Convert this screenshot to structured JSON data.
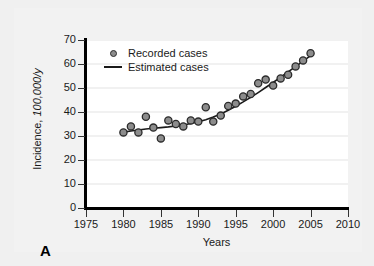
{
  "panel": {
    "label": "A"
  },
  "chart_data": {
    "type": "scatter",
    "title": "",
    "xlabel": "Years",
    "ylabel": "Incidence, 100,000/y",
    "ylabel_plain": "Incidence,",
    "ylabel_italic": " 100,000/y",
    "xlim": [
      1975,
      2010
    ],
    "ylim": [
      0,
      70
    ],
    "xticks": [
      1975,
      1980,
      1985,
      1990,
      1995,
      2000,
      2005,
      2010
    ],
    "yticks": [
      0,
      10,
      20,
      30,
      40,
      50,
      60,
      70
    ],
    "grid": "horizontal",
    "legend_position": "top-left",
    "series": [
      {
        "name": "Recorded cases",
        "type": "scatter",
        "marker": "circle",
        "marker_fill": "#8c8c8c",
        "marker_edge": "#2b2b2b",
        "x": [
          1980,
          1981,
          1982,
          1983,
          1984,
          1985,
          1986,
          1987,
          1988,
          1989,
          1990,
          1991,
          1992,
          1993,
          1994,
          1995,
          1996,
          1997,
          1998,
          1999,
          2000,
          2001,
          2002,
          2003,
          2004,
          2005
        ],
        "values": [
          31.5,
          34.0,
          31.5,
          38.0,
          33.5,
          29.0,
          36.5,
          35.0,
          34.0,
          36.5,
          36.0,
          42.0,
          36.0,
          38.5,
          42.5,
          43.5,
          46.5,
          47.5,
          52.0,
          53.5,
          51.0,
          54.0,
          55.5,
          59.0,
          61.5,
          64.5
        ]
      },
      {
        "name": "Estimated cases",
        "type": "line",
        "line_color": "#1a1a1a",
        "x": [
          1980,
          1981,
          1982,
          1983,
          1984,
          1985,
          1986,
          1987,
          1988,
          1989,
          1990,
          1991,
          1992,
          1993,
          1994,
          1995,
          1996,
          1997,
          1998,
          1999,
          2000,
          2001,
          2002,
          2003,
          2004,
          2005
        ],
        "values": [
          31.6,
          32.1,
          32.5,
          32.9,
          33.2,
          33.5,
          33.8,
          34.2,
          34.6,
          35.2,
          35.9,
          36.8,
          37.9,
          39.2,
          40.7,
          42.4,
          44.2,
          46.1,
          48.1,
          50.2,
          52.3,
          54.5,
          56.7,
          58.9,
          61.2,
          63.5
        ]
      }
    ]
  },
  "legend": {
    "items": [
      {
        "label": "Recorded cases",
        "symbol": "circle-marker"
      },
      {
        "label": "Estimated cases",
        "symbol": "line-segment"
      }
    ]
  },
  "colors": {
    "panel_background": "#f2f2f2",
    "plot_background": "#ffffff",
    "axis": "#000000",
    "gridline": "#e3e3e3",
    "text": "#1a1a1a"
  }
}
